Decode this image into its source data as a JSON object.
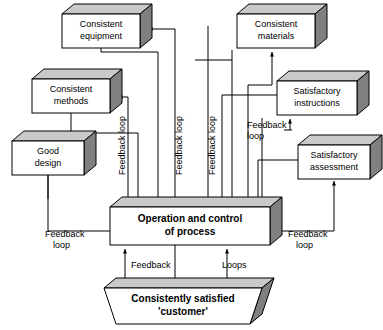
{
  "diagram": {
    "colors": {
      "box_face": "#ffffff",
      "box_top": "#c9c9c9",
      "box_side": "#808080",
      "line": "#000000",
      "background": "#ffffff"
    },
    "boxes": [
      {
        "id": "consistent-equipment",
        "line1": "Consistent",
        "line2": "equipment",
        "x": 62,
        "y": 14,
        "w": 78,
        "h": 34,
        "shape": "cube"
      },
      {
        "id": "consistent-materials",
        "line1": "Consistent",
        "line2": "materials",
        "x": 237,
        "y": 14,
        "w": 78,
        "h": 34,
        "shape": "cube"
      },
      {
        "id": "consistent-methods",
        "line1": "Consistent",
        "line2": "methods",
        "x": 32,
        "y": 79,
        "w": 78,
        "h": 34,
        "shape": "cube"
      },
      {
        "id": "satisfactory-instructions",
        "line1": "Satisfactory",
        "line2": "instructions",
        "x": 277,
        "y": 81,
        "w": 80,
        "h": 34,
        "shape": "cube"
      },
      {
        "id": "good-design",
        "line1": "Good",
        "line2": "design",
        "x": 12,
        "y": 141,
        "w": 72,
        "h": 34,
        "shape": "cube"
      },
      {
        "id": "satisfactory-assessment",
        "line1": "Satisfactory",
        "line2": "assessment",
        "x": 298,
        "y": 145,
        "w": 78,
        "h": 34,
        "shape": "cube"
      },
      {
        "id": "operation-control",
        "line1": "Operation and control",
        "line2": "of process",
        "x": 110,
        "y": 207,
        "w": 160,
        "h": 38,
        "shape": "cube",
        "bold": true
      },
      {
        "id": "consistently-satisfied-customer",
        "line1": "Consistently satisfied",
        "line2": "'customer'",
        "x": 118,
        "y": 288,
        "w": 144,
        "h": 36,
        "shape": "trapezoid",
        "bold": true
      }
    ],
    "labels": [
      {
        "id": "feedback-loop-vertical-1",
        "text_line1": "Feedback loop",
        "orientation": "vertical",
        "x": 128,
        "y": 175
      },
      {
        "id": "feedback-loop-vertical-2",
        "text_line1": "Feedback loop",
        "orientation": "vertical",
        "x": 185,
        "y": 175
      },
      {
        "id": "feedback-loop-vertical-3",
        "text_line1": "Feedback loop",
        "orientation": "vertical",
        "x": 218,
        "y": 175
      },
      {
        "id": "feedback-loop-right-upper",
        "text_line1": "Feedback",
        "text_line2": "loop",
        "orientation": "horizontal",
        "x": 247,
        "y": 125
      },
      {
        "id": "feedback-loop-left-lower",
        "text_line1": "Feedback",
        "text_line2": "loop",
        "orientation": "horizontal",
        "x": 45,
        "y": 231
      },
      {
        "id": "feedback-loop-right-lower",
        "text_line1": "Feedback",
        "text_line2": "loop",
        "orientation": "horizontal",
        "x": 286,
        "y": 231
      },
      {
        "id": "feedback-bottom",
        "text_line1": "Feedback",
        "orientation": "horizontal",
        "x": 130,
        "y": 262
      },
      {
        "id": "loops-bottom",
        "text_line1": "Loops",
        "orientation": "horizontal",
        "x": 218,
        "y": 262
      }
    ]
  }
}
